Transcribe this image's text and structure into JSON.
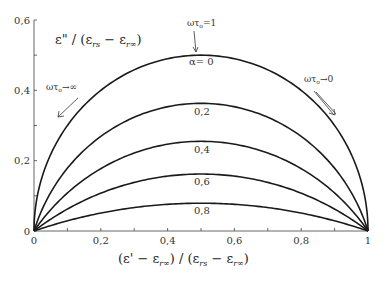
{
  "chart_data": {
    "type": "line",
    "title": "",
    "subtitle": "Cole-Cole diagram (normalized complex permittivity arcs)",
    "xlabel": "(ε' − ε_r∞) / (ε_rs − ε_r∞)",
    "ylabel": "ε\" / (ε_rs − ε_r∞)",
    "xlim": [
      0,
      1
    ],
    "ylim": [
      0,
      0.6
    ],
    "x_ticks": [
      "0",
      "0,2",
      "0,4",
      "0,6",
      "0,8",
      "1"
    ],
    "y_ticks": [
      "0",
      "0,2",
      "0,4",
      "0,6"
    ],
    "grid": false,
    "legend": "none (curves labeled inline)",
    "series": [
      {
        "name": "α= 0",
        "alpha": 0.0,
        "peak_x": 0.5,
        "peak_y": 0.5
      },
      {
        "name": "0,2",
        "alpha": 0.2,
        "peak_x": 0.5,
        "peak_y": 0.363
      },
      {
        "name": "0,4",
        "alpha": 0.4,
        "peak_x": 0.5,
        "peak_y": 0.255
      },
      {
        "name": "0,6",
        "alpha": 0.6,
        "peak_x": 0.5,
        "peak_y": 0.162
      },
      {
        "name": "0,8",
        "alpha": 0.8,
        "peak_x": 0.5,
        "peak_y": 0.079
      }
    ],
    "annotations": [
      {
        "text_main": "ωτ",
        "text_sub": "o",
        "text_tail": "=1",
        "points_to": "peak of α=0 arc (0.5, 0.5)"
      },
      {
        "text_main": "ωτ",
        "text_sub": "o",
        "text_tail": "→∞",
        "points_to": "left end of arcs (0,0)"
      },
      {
        "text_main": "ωτ",
        "text_sub": "o",
        "text_tail": "→0",
        "points_to": "right end of arcs (1,0)"
      }
    ]
  },
  "labels": {
    "ylabel_parts": [
      "ε\" / (",
      "ε",
      "rs",
      " − ",
      "ε",
      "r∞",
      ")"
    ],
    "xlabel_parts": [
      "(",
      "ε' − ε",
      "r∞",
      ") / (",
      "ε",
      "rs",
      " − ",
      "ε",
      "r∞",
      ")"
    ]
  }
}
